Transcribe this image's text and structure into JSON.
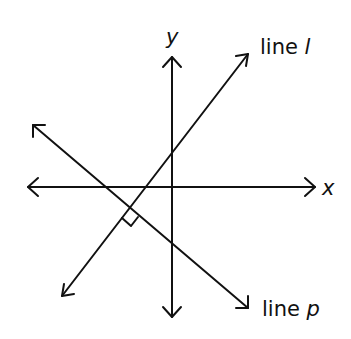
{
  "diagram": {
    "type": "coordinate-plane",
    "axes": {
      "x": {
        "label": "x",
        "from": [
          28,
          187
        ],
        "to": [
          315,
          187
        ]
      },
      "y": {
        "label": "y",
        "from": [
          172,
          317
        ],
        "to": [
          172,
          57
        ]
      }
    },
    "lines": [
      {
        "id": "l",
        "label_prefix": "line ",
        "label_var": "l",
        "from": [
          62,
          296
        ],
        "to": [
          248,
          54
        ]
      },
      {
        "id": "p",
        "label_prefix": "line ",
        "label_var": "p",
        "from": [
          33,
          125
        ],
        "to": [
          248,
          308
        ]
      }
    ],
    "annotations": {
      "right_angle": {
        "between": [
          "line l",
          "line p"
        ],
        "at": [
          129,
          211
        ]
      }
    },
    "colors": {
      "stroke": "#111111",
      "background": "#ffffff"
    }
  }
}
